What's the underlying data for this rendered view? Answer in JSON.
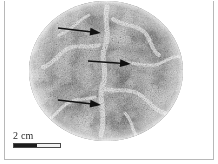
{
  "figure": {
    "type": "photomicrograph",
    "background_color": "#ffffff",
    "frame_color": "#b8b8b8"
  },
  "specimen": {
    "shape": "circle",
    "center_x": 106,
    "center_y": 71,
    "radius_x": 77,
    "radius_y": 70,
    "base_color": "#9d9d9d",
    "light_patch_color": "#e2e2e2",
    "dark_speckle_color": "#4f4f4f",
    "texture": "fine-granular-speckle"
  },
  "annotations": {
    "arrow_color": "#111111",
    "arrows": [
      {
        "name": "arrow-top",
        "label": "",
        "x1": 58,
        "y1": 28,
        "x2": 101,
        "y2": 33
      },
      {
        "name": "arrow-middle",
        "label": "",
        "x1": 88,
        "y1": 61,
        "x2": 131,
        "y2": 64
      },
      {
        "name": "arrow-bottom",
        "label": "",
        "x1": 58,
        "y1": 100,
        "x2": 101,
        "y2": 105
      }
    ]
  },
  "scale_bar": {
    "label": "2 cm",
    "value": 2,
    "unit": "cm",
    "bar_width_px": 48,
    "filled_fraction": 0.5,
    "fill_color": "#1d1d1d",
    "empty_color": "#f2f2f2",
    "outline_color": "#4a4a4a"
  }
}
